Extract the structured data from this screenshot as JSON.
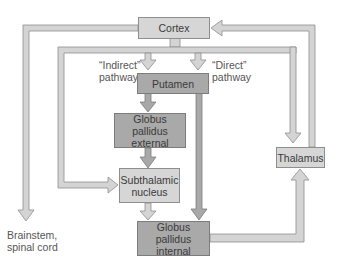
{
  "diagram": {
    "nodes": {
      "cortex": "Cortex",
      "putamen": "Putamen",
      "gpe": [
        "Globus pallidus",
        "external"
      ],
      "stn": [
        "Subthalamic",
        "nucleus"
      ],
      "gpi": [
        "Globus pallidus",
        "internal"
      ],
      "thalamus": "Thalamus",
      "brainstem": [
        "Brainstem,",
        "spinal cord"
      ]
    },
    "pathway_labels": {
      "indirect": [
        "“Indirect”",
        "pathway"
      ],
      "direct": [
        "“Direct”",
        "pathway"
      ]
    },
    "edges": [
      {
        "from": "Cortex",
        "to": "Putamen",
        "label": "Indirect pathway"
      },
      {
        "from": "Cortex",
        "to": "Putamen",
        "label": "Direct pathway"
      },
      {
        "from": "Cortex",
        "to": "Brainstem, spinal cord"
      },
      {
        "from": "Cortex",
        "to": "Subthalamic nucleus"
      },
      {
        "from": "Cortex",
        "to": "Thalamus"
      },
      {
        "from": "Putamen",
        "to": "Globus pallidus external"
      },
      {
        "from": "Putamen",
        "to": "Globus pallidus internal"
      },
      {
        "from": "Globus pallidus external",
        "to": "Subthalamic nucleus"
      },
      {
        "from": "Subthalamic nucleus",
        "to": "Globus pallidus internal"
      },
      {
        "from": "Globus pallidus internal",
        "to": "Thalamus"
      },
      {
        "from": "Thalamus",
        "to": "Cortex"
      }
    ],
    "colors": {
      "light_fill": "#d6d6d6",
      "dark_fill": "#a9a9a9",
      "pipe_light": "#d4d4d4",
      "pipe_dark": "#a8a8a8",
      "outline": "#8e8e8e"
    }
  }
}
